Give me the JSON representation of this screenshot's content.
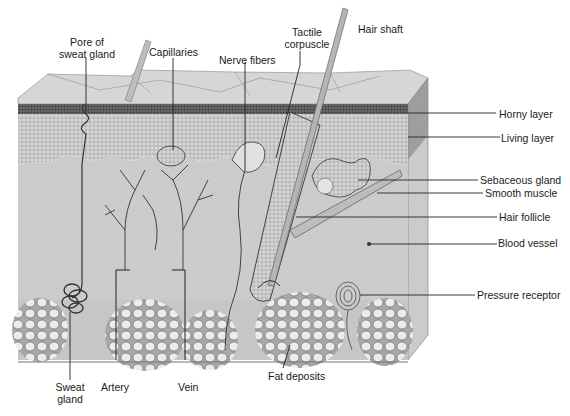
{
  "figure": {
    "colors": {
      "background": "#ffffff",
      "surface": "#d4d4d4",
      "dermis": "#cfcfcf",
      "epidermis_texture": "#bdbdbd",
      "fat": "#e6e6e6",
      "line": "#1a1a1a"
    }
  },
  "labels": {
    "top": [
      {
        "id": "pore",
        "line1": "Pore of",
        "line2": "sweat gland"
      },
      {
        "id": "capillaries",
        "line1": "Capillaries"
      },
      {
        "id": "nerve",
        "line1": "Nerve fibers"
      },
      {
        "id": "tactile",
        "line1": "Tactile",
        "line2": "corpuscle"
      },
      {
        "id": "hair_shaft",
        "line1": "Hair shaft"
      }
    ],
    "right": [
      {
        "id": "horny",
        "text": "Horny layer"
      },
      {
        "id": "living",
        "text": "Living layer"
      },
      {
        "id": "sebaceous",
        "text": "Sebaceous gland"
      },
      {
        "id": "smooth_muscle",
        "text": "Smooth muscle"
      },
      {
        "id": "hair_follicle",
        "text": "Hair follicle"
      },
      {
        "id": "blood_vessel",
        "text": "Blood vessel"
      },
      {
        "id": "pressure",
        "text": "Pressure receptor"
      }
    ],
    "bottom": [
      {
        "id": "sweat_gland",
        "line1": "Sweat",
        "line2": "gland"
      },
      {
        "id": "artery",
        "line1": "Artery"
      },
      {
        "id": "vein",
        "line1": "Vein"
      },
      {
        "id": "fat",
        "line1": "Fat deposits"
      }
    ]
  }
}
